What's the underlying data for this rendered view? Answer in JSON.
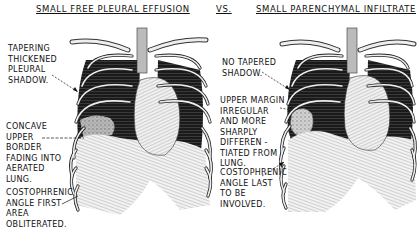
{
  "titles": {
    "left": "SMALL FREE PLEURAL EFFUSION",
    "vs": "VS.",
    "right": "SMALL PARENCHYMAL INFILTRATE"
  },
  "left_panel": {
    "labels": [
      {
        "id": "tapering",
        "text": "TAPERING\nTHICKENED\nPLEURAL\nSHADOW."
      },
      {
        "id": "concave",
        "text": "CONCAVE\nUPPER\nBORDER\nFADING INTO\nAERATED\nLUNG."
      },
      {
        "id": "costophrenic",
        "text": "COSTOPHRENIC\nANGLE FIRST\nAREA\nOBLITERATED."
      }
    ]
  },
  "right_panel": {
    "labels": [
      {
        "id": "no-tapered",
        "text": "NO TAPERED\nSHADOW."
      },
      {
        "id": "upper-margin",
        "text": "UPPER MARGIN\nIRREGULAR\nAND MORE\nSHARPLY\nDIFFEREN -\nTIATED FROM\nLUNG."
      },
      {
        "id": "costophrenic",
        "text": "COSTOPHRENIC\nANGLE LAST\nTO BE\nINVOLVED."
      }
    ]
  },
  "colors": {
    "ink": "#111111",
    "background": "#ffffff",
    "lung_dark": "#1a1a1a",
    "tissue": "#d8d8d8"
  }
}
